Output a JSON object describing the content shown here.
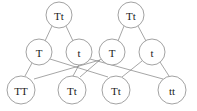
{
  "diagram": {
    "type": "genetics-cross-tree",
    "width": 197,
    "height": 111,
    "colors": {
      "background": "#ffffff",
      "node_stroke": "#8a8a8a",
      "node_fill": "#ffffff",
      "edge_stroke": "#808080",
      "text": "#1a1a1a"
    },
    "rows": {
      "parents": {
        "label": "parent-generation",
        "nodes": [
          {
            "id": "p1",
            "label": "Tt",
            "cx": 59,
            "cy": 15,
            "r": 13,
            "font_size": 11
          },
          {
            "id": "p2",
            "label": "Tt",
            "cx": 131,
            "cy": 15,
            "r": 13,
            "font_size": 11
          }
        ]
      },
      "gametes": {
        "label": "gamete-generation",
        "nodes": [
          {
            "id": "g1",
            "label": "T",
            "cx": 39,
            "cy": 52,
            "r": 13,
            "font_size": 11
          },
          {
            "id": "g2",
            "label": "t",
            "cx": 79,
            "cy": 52,
            "r": 13,
            "font_size": 11
          },
          {
            "id": "g3",
            "label": "T",
            "cx": 112,
            "cy": 52,
            "r": 13,
            "font_size": 11
          },
          {
            "id": "g4",
            "label": "t",
            "cx": 152,
            "cy": 52,
            "r": 13,
            "font_size": 11
          }
        ]
      },
      "offspring": {
        "label": "offspring-generation",
        "nodes": [
          {
            "id": "o1",
            "label": "TT",
            "cx": 21,
            "cy": 90,
            "r": 14,
            "font_size": 11
          },
          {
            "id": "o2",
            "label": "Tt",
            "cx": 72,
            "cy": 90,
            "r": 14,
            "font_size": 11
          },
          {
            "id": "o3",
            "label": "Tt",
            "cx": 116,
            "cy": 90,
            "r": 14,
            "font_size": 11
          },
          {
            "id": "o4",
            "label": "tt",
            "cx": 172,
            "cy": 90,
            "r": 14,
            "font_size": 11
          }
        ]
      }
    },
    "edges": [
      {
        "id": "e1",
        "from": "p1",
        "to": "g1",
        "x1": 52,
        "y1": 26,
        "x2": 45,
        "y2": 41
      },
      {
        "id": "e2",
        "from": "p1",
        "to": "g2",
        "x1": 66,
        "y1": 26,
        "x2": 73,
        "y2": 41
      },
      {
        "id": "e3",
        "from": "p2",
        "to": "g3",
        "x1": 124,
        "y1": 26,
        "x2": 118,
        "y2": 41
      },
      {
        "id": "e4",
        "from": "p2",
        "to": "g4",
        "x1": 138,
        "y1": 26,
        "x2": 146,
        "y2": 41
      },
      {
        "id": "e5",
        "from": "g1",
        "to": "o1",
        "x1": 32,
        "y1": 63,
        "x2": 25,
        "y2": 76
      },
      {
        "id": "e6",
        "from": "g1",
        "to": "o3",
        "x1": 50,
        "y1": 59,
        "x2": 108,
        "y2": 77
      },
      {
        "id": "e7",
        "from": "g2",
        "to": "o2",
        "x1": 79,
        "y1": 65,
        "x2": 73,
        "y2": 76
      },
      {
        "id": "e8",
        "from": "g2",
        "to": "o4",
        "x1": 90,
        "y1": 59,
        "x2": 163,
        "y2": 79
      },
      {
        "id": "e9",
        "from": "g3",
        "to": "o2",
        "x1": 101,
        "y1": 59,
        "x2": 80,
        "y2": 77
      },
      {
        "id": "e10",
        "from": "g3",
        "to": "o1",
        "x1": 100,
        "y1": 60,
        "x2": 34,
        "y2": 79
      },
      {
        "id": "e11",
        "from": "g4",
        "to": "o4",
        "x1": 160,
        "y1": 62,
        "x2": 169,
        "y2": 76
      },
      {
        "id": "e12",
        "from": "g4",
        "to": "o3",
        "x1": 142,
        "y1": 61,
        "x2": 122,
        "y2": 77
      }
    ]
  }
}
